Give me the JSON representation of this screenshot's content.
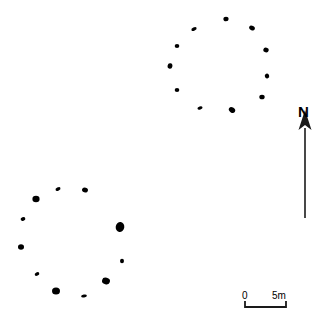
{
  "figure": {
    "type": "archaeological-site-plan",
    "background_color": "#ffffff",
    "stone_color": "#000000",
    "width": 327,
    "height": 322
  },
  "north_arrow": {
    "label": "N",
    "shaft_x": 305,
    "shaft_top": 128,
    "shaft_bottom": 218,
    "head_width": 13,
    "head_height": 18
  },
  "scale_bar": {
    "label_start": "0",
    "label_end": "5m",
    "x_start": 245,
    "x_end": 286,
    "y_baseline": 307,
    "tick_height": 6
  },
  "features": [
    {
      "name": "northern-stone-circle",
      "center_x": 223,
      "center_y": 64,
      "stones": [
        {
          "cx": 226,
          "cy": 19,
          "rx": 2.6,
          "ry": 2.3,
          "rot": 0
        },
        {
          "cx": 194,
          "cy": 29,
          "rx": 2.8,
          "ry": 1.7,
          "rot": -25
        },
        {
          "cx": 252,
          "cy": 28,
          "rx": 3.0,
          "ry": 2.2,
          "rot": 30
        },
        {
          "cx": 177,
          "cy": 46,
          "rx": 2.3,
          "ry": 1.9,
          "rot": 0
        },
        {
          "cx": 266,
          "cy": 50,
          "rx": 2.7,
          "ry": 2.4,
          "rot": 15
        },
        {
          "cx": 170,
          "cy": 66,
          "rx": 2.4,
          "ry": 2.8,
          "rot": 10
        },
        {
          "cx": 267,
          "cy": 76,
          "rx": 2.2,
          "ry": 2.4,
          "rot": -20
        },
        {
          "cx": 177,
          "cy": 90,
          "rx": 2.3,
          "ry": 2.0,
          "rot": 0
        },
        {
          "cx": 262,
          "cy": 97,
          "rx": 2.7,
          "ry": 2.3,
          "rot": 0
        },
        {
          "cx": 200,
          "cy": 108,
          "rx": 2.6,
          "ry": 1.6,
          "rot": -15
        },
        {
          "cx": 232,
          "cy": 110,
          "rx": 3.4,
          "ry": 2.6,
          "rot": 35
        }
      ]
    },
    {
      "name": "southern-stone-circle",
      "center_x": 72,
      "center_y": 243,
      "stones": [
        {
          "cx": 58,
          "cy": 189,
          "rx": 2.7,
          "ry": 1.6,
          "rot": -30
        },
        {
          "cx": 85,
          "cy": 190,
          "rx": 3.0,
          "ry": 2.4,
          "rot": 20
        },
        {
          "cx": 36,
          "cy": 199,
          "rx": 3.6,
          "ry": 3.2,
          "rot": 0
        },
        {
          "cx": 23,
          "cy": 219,
          "rx": 2.4,
          "ry": 1.8,
          "rot": -20
        },
        {
          "cx": 120,
          "cy": 227,
          "rx": 4.3,
          "ry": 5.0,
          "rot": 10
        },
        {
          "cx": 21,
          "cy": 247,
          "rx": 3.0,
          "ry": 2.8,
          "rot": 0
        },
        {
          "cx": 122,
          "cy": 261,
          "rx": 2.0,
          "ry": 2.2,
          "rot": 0
        },
        {
          "cx": 37,
          "cy": 274,
          "rx": 2.4,
          "ry": 1.7,
          "rot": -25
        },
        {
          "cx": 106,
          "cy": 281,
          "rx": 4.0,
          "ry": 3.3,
          "rot": 15
        },
        {
          "cx": 56,
          "cy": 291,
          "rx": 4.0,
          "ry": 3.6,
          "rot": 0
        },
        {
          "cx": 84,
          "cy": 296,
          "rx": 2.9,
          "ry": 1.5,
          "rot": -10
        }
      ]
    }
  ]
}
